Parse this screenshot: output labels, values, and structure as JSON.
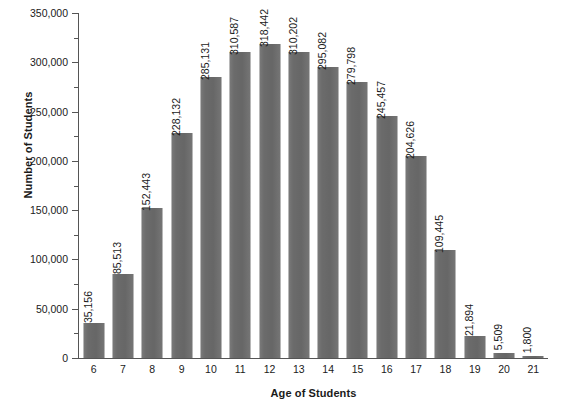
{
  "chart_data": {
    "type": "bar",
    "title": "",
    "xlabel": "Age of Students",
    "ylabel": "Number of Students",
    "categories": [
      "6",
      "7",
      "8",
      "9",
      "10",
      "11",
      "12",
      "13",
      "14",
      "15",
      "16",
      "17",
      "18",
      "19",
      "20",
      "21"
    ],
    "values": [
      35156,
      85513,
      152443,
      228132,
      285131,
      310587,
      318442,
      310202,
      295082,
      279798,
      245457,
      204626,
      109445,
      21894,
      5509,
      1800
    ],
    "value_labels": [
      "35,156",
      "85,513",
      "152,443",
      "228,132",
      "285,131",
      "310,587",
      "318,442",
      "310,202",
      "295,082",
      "279,798",
      "245,457",
      "204,626",
      "109,445",
      "21,894",
      "5,509",
      "1,800"
    ],
    "ylim": [
      0,
      350000
    ],
    "ytick_labels": [
      "0",
      "50,000",
      "100,000",
      "150,000",
      "200,000",
      "250,000",
      "300,000",
      "350,000"
    ],
    "ytick_values": [
      0,
      50000,
      100000,
      150000,
      200000,
      250000,
      300000,
      350000
    ],
    "yminor_values": [
      25000,
      75000,
      125000,
      175000,
      225000,
      275000,
      325000
    ],
    "grid": false,
    "legend": null,
    "bar_color": "#6b6b6b",
    "axis_color": "#555555",
    "background_color": "#ffffff"
  }
}
